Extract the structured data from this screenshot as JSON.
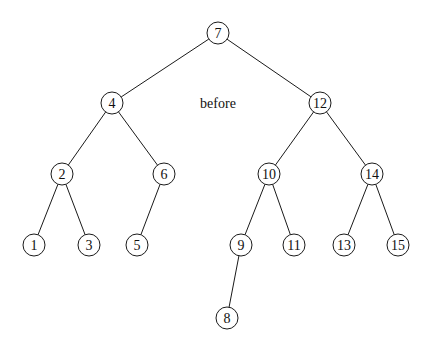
{
  "diagram": {
    "type": "binary-search-tree",
    "caption": "before",
    "root": "7",
    "nodes": [
      {
        "id": "7",
        "label": "7"
      },
      {
        "id": "4",
        "label": "4"
      },
      {
        "id": "12",
        "label": "12"
      },
      {
        "id": "2",
        "label": "2"
      },
      {
        "id": "6",
        "label": "6"
      },
      {
        "id": "10",
        "label": "10"
      },
      {
        "id": "14",
        "label": "14"
      },
      {
        "id": "1",
        "label": "1"
      },
      {
        "id": "3",
        "label": "3"
      },
      {
        "id": "5",
        "label": "5"
      },
      {
        "id": "9",
        "label": "9"
      },
      {
        "id": "11",
        "label": "11"
      },
      {
        "id": "13",
        "label": "13"
      },
      {
        "id": "15",
        "label": "15"
      },
      {
        "id": "8",
        "label": "8"
      }
    ],
    "edges": [
      {
        "from": "7",
        "to": "4"
      },
      {
        "from": "7",
        "to": "12"
      },
      {
        "from": "4",
        "to": "2"
      },
      {
        "from": "4",
        "to": "6"
      },
      {
        "from": "12",
        "to": "10"
      },
      {
        "from": "12",
        "to": "14"
      },
      {
        "from": "2",
        "to": "1"
      },
      {
        "from": "2",
        "to": "3"
      },
      {
        "from": "6",
        "to": "5"
      },
      {
        "from": "10",
        "to": "9"
      },
      {
        "from": "10",
        "to": "11"
      },
      {
        "from": "14",
        "to": "13"
      },
      {
        "from": "14",
        "to": "15"
      },
      {
        "from": "9",
        "to": "8"
      }
    ]
  }
}
